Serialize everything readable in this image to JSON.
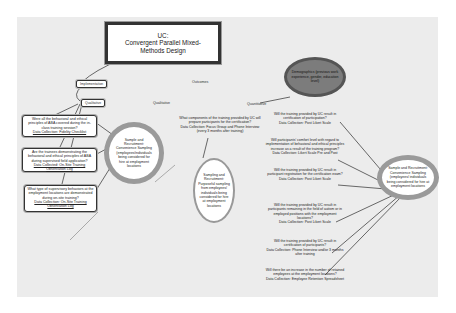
{
  "diagram": {
    "title": {
      "line1": "UC:",
      "line2": "Convergent Parallel Mixed-",
      "line3": "Methods Design"
    },
    "labels": {
      "implementation": "Implementation",
      "qualitative_tag": "Qualitative",
      "outcomes": "Outcomes",
      "qualitative_mid": "Qualitative",
      "quantitative": "Quantitative"
    },
    "demographics": "Demographics (previous work experience, gender, education level)",
    "left_questions": [
      {
        "question": "Were all the behavioral and ethical principles of ABA covered during the in-class training session?",
        "data_collection": "Data Collection: Fidelity Checklist"
      },
      {
        "question": "Are the trainees demonstrating the behavioral and ethical principles of ABA during supervised field application?",
        "data_collection": "Data Collected: On-Site Training Observation Log"
      },
      {
        "question": "What type of supervisory behaviors at the employment locations are demonstrated during on-site training?",
        "data_collection": "Data Collection: On-Site Training Observation Log"
      }
    ],
    "left_sample": "Sample and Recruitment: Convenience Sampling (employees/individuals being considered for hire at employment locations",
    "middle_question": {
      "question": "What components of the training provided by UC will prepare participants for the certification?",
      "data_collection": "Data Collection: Focus Group and Phone Interview (every 3 months after training)"
    },
    "middle_sample": "Sampling and Recruitment: Purposeful sampling from employees/ individuals being considered for hire at employment locations",
    "right_questions": [
      {
        "question": "Will the training provided by UC result in certification of participation?",
        "data_collection": "Data Collection: Post Likert Scale"
      },
      {
        "question": "Will participants' comfort level with regard to implementation of behavioral and ethical principles increase as a result of the training program?",
        "data_collection": "Data Collection: Likert Scale Pre and Post"
      },
      {
        "question": "Will the training provided by UC result in participant registration for the certification exam?",
        "data_collection": "Data Collection: Post Likert Scale"
      },
      {
        "question": "Will the training provided by UC result in participants remaining in the field of autism or in employed positions with the employment locations?",
        "data_collection": "Data Collection: Post Likert Scale"
      },
      {
        "question": "Will the training provided by UC result in certification of participants?",
        "data_collection": "Data Collection: Phone Interview and/or 3 months after training"
      },
      {
        "question": "Will there be an increase in the number of retained employees at the employment locations?",
        "data_collection": "Data Collection: Employee Retention Spreadsheet"
      }
    ],
    "right_sample": "Sample and Recruitment: Convenience Sampling (employees/ individuals being considered for hire at employment locations",
    "colors": {
      "canvas": "#ececec",
      "border": "#333333",
      "ellipse_ring": "#9a9a9a",
      "demographics_fill": "#7c7c7c"
    }
  }
}
